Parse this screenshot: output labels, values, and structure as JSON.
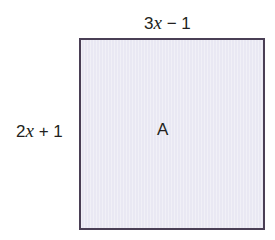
{
  "diagram": {
    "shape": "rectangle",
    "fill_color": "#e9e8f3",
    "border_color": "#4a3f55",
    "top_side": {
      "coef": "3",
      "var": "x",
      "rest": " − 1"
    },
    "left_side": {
      "coef": "2",
      "var": "x",
      "rest": " + 1"
    },
    "area_label": "A"
  }
}
